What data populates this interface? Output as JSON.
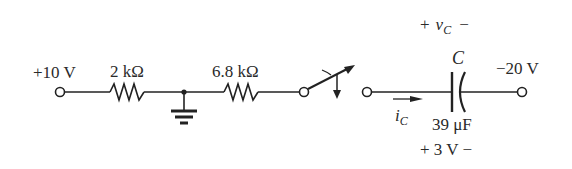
{
  "diagram": {
    "type": "circuit",
    "source_left": {
      "label": "+10 V"
    },
    "resistor_1": {
      "label": "2 kΩ"
    },
    "ground": {
      "label": ""
    },
    "resistor_2": {
      "label": "6.8 kΩ"
    },
    "switch": {
      "state": "moving"
    },
    "capacitor": {
      "name": "C",
      "voltage_label_plus": "+",
      "voltage_label_var": "v",
      "voltage_label_sub": "C",
      "voltage_label_minus": "−",
      "value": "39 μF",
      "initial_voltage": "+ 3 V −"
    },
    "current": {
      "var": "i",
      "sub": "C"
    },
    "source_right": {
      "label": "−20 V"
    }
  }
}
